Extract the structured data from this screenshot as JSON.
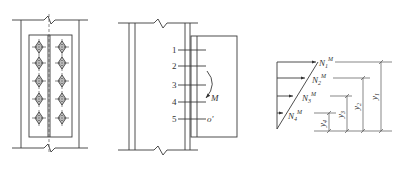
{
  "figure": {
    "panel_a": {
      "description": "Front view of bolted splice plate on column with two columns of five bolts",
      "bolt_columns": 2,
      "bolt_rows": 5
    },
    "panel_b": {
      "row_labels": [
        "1",
        "2",
        "3",
        "4",
        "5"
      ],
      "moment_label": "M",
      "center_label": "o'"
    },
    "panel_c": {
      "forces": [
        {
          "base": "N",
          "sub": "1",
          "sup": "M"
        },
        {
          "base": "N",
          "sub": "2",
          "sup": "M"
        },
        {
          "base": "N",
          "sub": "3",
          "sup": "M"
        },
        {
          "base": "N",
          "sub": "4",
          "sup": "M"
        }
      ],
      "dimensions": [
        {
          "base": "y",
          "sub": "1"
        },
        {
          "base": "y",
          "sub": "2"
        },
        {
          "base": "y",
          "sub": "3"
        },
        {
          "base": "y",
          "sub": "4"
        }
      ]
    }
  }
}
